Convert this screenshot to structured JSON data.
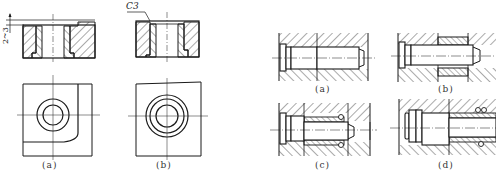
{
  "figure_left": {
    "panels": [
      {
        "id": "a",
        "label": "(a)"
      },
      {
        "id": "b",
        "label": "(b)"
      }
    ],
    "annotations": {
      "chamfer": "C3",
      "dimension": "2~3"
    }
  },
  "figure_right": {
    "panels": [
      {
        "id": "a",
        "label": "(a)"
      },
      {
        "id": "b",
        "label": "(b)"
      },
      {
        "id": "c",
        "label": "(c)"
      },
      {
        "id": "d",
        "label": "(d)"
      }
    ]
  },
  "colors": {
    "line": "#1a1a1a",
    "hatch": "#2a2a2a",
    "background": "#ffffff"
  }
}
